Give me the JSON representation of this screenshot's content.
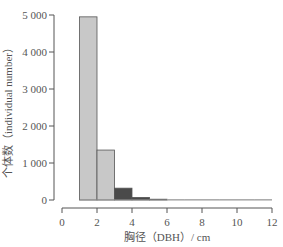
{
  "chart_data": {
    "type": "bar",
    "title": "",
    "xlabel": "胸径（DBH）/ cm",
    "ylabel": "个体数（individual number）",
    "x_bins": [
      [
        1,
        2
      ],
      [
        2,
        3
      ],
      [
        3,
        4
      ],
      [
        4,
        5
      ],
      [
        5,
        6
      ],
      [
        6,
        7
      ],
      [
        7,
        8
      ],
      [
        8,
        9
      ],
      [
        9,
        10
      ],
      [
        10,
        11
      ],
      [
        11,
        12
      ]
    ],
    "categories": [
      "1-2",
      "2-3",
      "3-4",
      "4-5",
      "5-6",
      "6-7",
      "7-8",
      "8-9",
      "9-10",
      "10-11",
      "11-12"
    ],
    "values": [
      4950,
      1350,
      320,
      70,
      20,
      10,
      8,
      6,
      5,
      4,
      3
    ],
    "bar_colors": [
      "#c8c8c8",
      "#c8c8c8",
      "#4a4a4a",
      "#4a4a4a",
      "#6a6a6a",
      "#b0b0b0",
      "#b0b0b0",
      "#b0b0b0",
      "#b0b0b0",
      "#b0b0b0",
      "#b0b0b0"
    ],
    "xlim": [
      0,
      12
    ],
    "ylim": [
      0,
      5000
    ],
    "xticks": [
      0,
      2,
      4,
      6,
      8,
      10,
      12
    ],
    "xtick_labels": [
      "0",
      "2",
      "4",
      "6",
      "8",
      "10",
      "12"
    ],
    "yticks": [
      0,
      1000,
      2000,
      3000,
      4000,
      5000
    ],
    "ytick_labels": [
      "0",
      "1 000",
      "2 000",
      "3 000",
      "4 000",
      "5 000"
    ],
    "grid": false,
    "legend": null
  }
}
